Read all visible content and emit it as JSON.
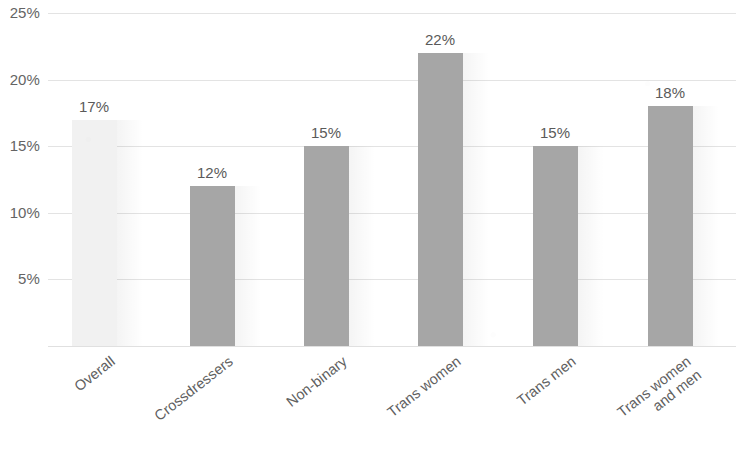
{
  "chart_data": {
    "type": "bar",
    "title": "",
    "subtitle": "",
    "xlabel": "",
    "ylabel": "",
    "categories": [
      "Overall",
      "Crossdressers",
      "Non-binary",
      "Trans women",
      "Trans men",
      "Trans women\nand men"
    ],
    "values": [
      17,
      12,
      15,
      22,
      15,
      18
    ],
    "data_labels": [
      "17%",
      "12%",
      "15%",
      "22%",
      "15%",
      "18%"
    ],
    "series": [
      {
        "name": "",
        "values": [
          17,
          12,
          15,
          22,
          15,
          18
        ]
      }
    ],
    "ylim": [
      0,
      25
    ],
    "y_ticks": [
      25,
      20,
      15,
      10,
      5
    ],
    "y_tick_labels": [
      "25%",
      "20%",
      "15%",
      "10%",
      "5%"
    ],
    "grid": true,
    "legend": false,
    "legend_position": "none",
    "bar_colors": [
      "#f1f1f1",
      "#a6a6a6",
      "#a6a6a6",
      "#a6a6a6",
      "#a6a6a6",
      "#a6a6a6"
    ],
    "highlight_color": "#a6a6a6",
    "muted_color": "#f1f1f1",
    "gridline_color": "#e3e3e3",
    "text_color": "#606060",
    "background_color": "#ffffff"
  }
}
